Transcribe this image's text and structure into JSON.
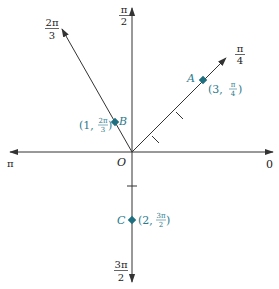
{
  "diagram": {
    "type": "polar-coordinate-plot",
    "origin_label": "O",
    "colors": {
      "axis": "#333333",
      "point": "#1f6f80",
      "point_label": "#2a7a8c",
      "text": "#222222"
    },
    "axis_labels": {
      "zero": "0",
      "pi": "π",
      "half_pi_num": "π",
      "half_pi_den": "2",
      "three_half_pi_num": "3π",
      "three_half_pi_den": "2",
      "quarter_pi_num": "π",
      "quarter_pi_den": "4",
      "two_third_pi_num": "2π",
      "two_third_pi_den": "3"
    },
    "points": [
      {
        "name": "A",
        "r": 3,
        "theta": "π/4",
        "coord_open": "(3, ",
        "theta_num": "π",
        "theta_den": "4",
        "coord_close": ")"
      },
      {
        "name": "B",
        "r": 1,
        "theta": "2π/3",
        "coord_open": "(1, ",
        "theta_num": "2π",
        "theta_den": "3",
        "coord_close": ")"
      },
      {
        "name": "C",
        "r": 2,
        "theta": "3π/2",
        "coord_open": "(2, ",
        "theta_num": "3π",
        "theta_den": "2",
        "coord_close": ")"
      }
    ]
  }
}
